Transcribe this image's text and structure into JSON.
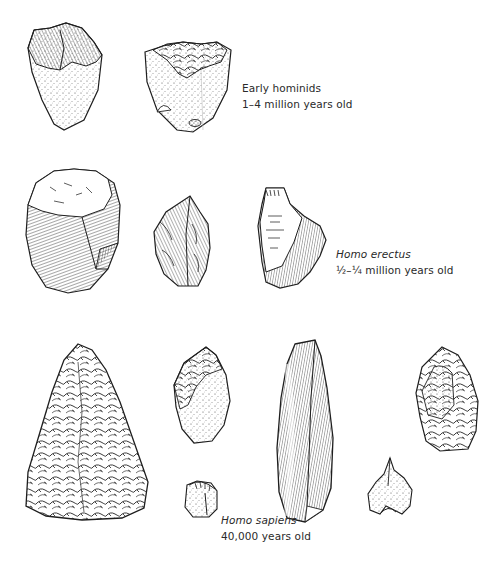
{
  "figure": {
    "groups": [
      {
        "id": "early-hominids",
        "species": "Early hominids",
        "species_italic": false,
        "age": "1–4 million years old",
        "artifact_count": 2
      },
      {
        "id": "homo-erectus",
        "species": "Homo erectus",
        "species_italic": true,
        "age": "½–¼ million years old",
        "artifact_count": 3
      },
      {
        "id": "homo-sapiens",
        "species": "Homo sapiens",
        "species_italic": true,
        "age": "40,000 years old",
        "artifact_count": 7
      }
    ],
    "colors": {
      "ink": "#1e1e1e",
      "background": "#ffffff"
    }
  }
}
